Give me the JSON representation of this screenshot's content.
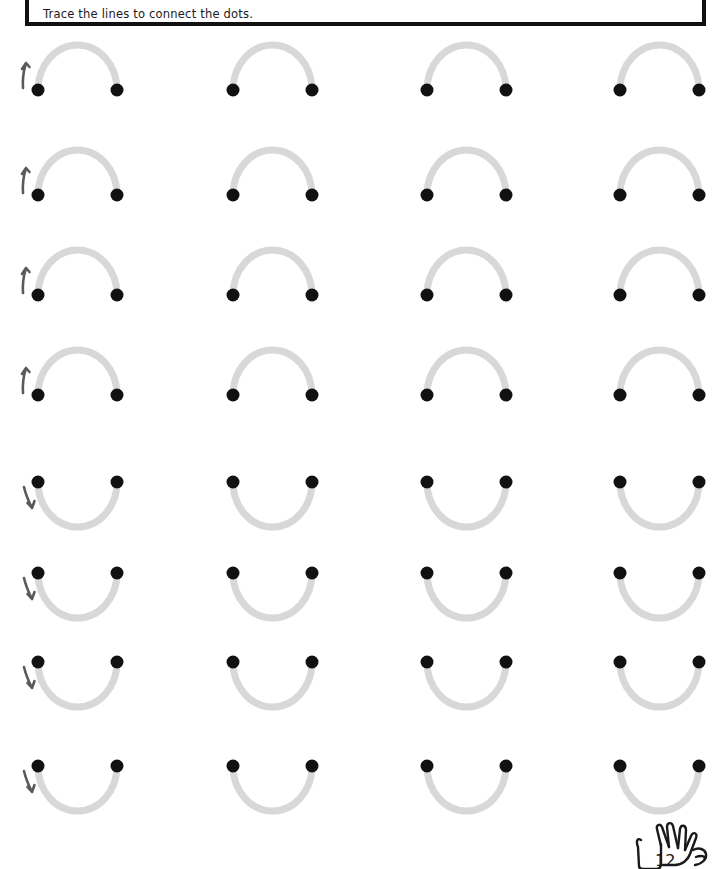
{
  "page": {
    "background_color": "#ffffff",
    "width": 723,
    "height": 869
  },
  "instruction": {
    "text": "Trace the lines to connect the dots.",
    "border_color": "#111111",
    "text_color": "#1a1a1a"
  },
  "colors": {
    "trace_line": "#d8d8d8",
    "dot": "#111111",
    "arrow": "#5a5a5a",
    "logo_outline": "#1a1a1a"
  },
  "grid": {
    "rows": 8,
    "columns": 4,
    "column_x": [
      38,
      233,
      427,
      620
    ],
    "row_y": [
      90,
      195,
      295,
      395,
      482,
      573,
      662,
      766
    ],
    "dot_span": 79,
    "dot_radius": 6.5,
    "arc_height": 45,
    "line_width": 7
  },
  "exercises": [
    {
      "row": 1,
      "shape": "arch-up",
      "items": [
        {
          "column": 1,
          "arrow": "up",
          "arrow_label": "start-arrow-up"
        },
        {
          "column": 2,
          "arrow": "none"
        },
        {
          "column": 3,
          "arrow": "none"
        },
        {
          "column": 4,
          "arrow": "none"
        }
      ]
    },
    {
      "row": 2,
      "shape": "arch-up",
      "items": [
        {
          "column": 1,
          "arrow": "up",
          "arrow_label": "start-arrow-up"
        },
        {
          "column": 2,
          "arrow": "none"
        },
        {
          "column": 3,
          "arrow": "none"
        },
        {
          "column": 4,
          "arrow": "none"
        }
      ]
    },
    {
      "row": 3,
      "shape": "arch-up",
      "items": [
        {
          "column": 1,
          "arrow": "up",
          "arrow_label": "start-arrow-up"
        },
        {
          "column": 2,
          "arrow": "none"
        },
        {
          "column": 3,
          "arrow": "none"
        },
        {
          "column": 4,
          "arrow": "none"
        }
      ]
    },
    {
      "row": 4,
      "shape": "arch-up",
      "items": [
        {
          "column": 1,
          "arrow": "up",
          "arrow_label": "start-arrow-up"
        },
        {
          "column": 2,
          "arrow": "none"
        },
        {
          "column": 3,
          "arrow": "none"
        },
        {
          "column": 4,
          "arrow": "none"
        }
      ]
    },
    {
      "row": 5,
      "shape": "arch-down",
      "items": [
        {
          "column": 1,
          "arrow": "down",
          "arrow_label": "start-arrow-down"
        },
        {
          "column": 2,
          "arrow": "none"
        },
        {
          "column": 3,
          "arrow": "none"
        },
        {
          "column": 4,
          "arrow": "none"
        }
      ]
    },
    {
      "row": 6,
      "shape": "arch-down",
      "items": [
        {
          "column": 1,
          "arrow": "down",
          "arrow_label": "start-arrow-down"
        },
        {
          "column": 2,
          "arrow": "none"
        },
        {
          "column": 3,
          "arrow": "none"
        },
        {
          "column": 4,
          "arrow": "none"
        }
      ]
    },
    {
      "row": 7,
      "shape": "arch-down",
      "items": [
        {
          "column": 1,
          "arrow": "down",
          "arrow_label": "start-arrow-down"
        },
        {
          "column": 2,
          "arrow": "none"
        },
        {
          "column": 3,
          "arrow": "none"
        },
        {
          "column": 4,
          "arrow": "none"
        }
      ]
    },
    {
      "row": 8,
      "shape": "arch-down",
      "items": [
        {
          "column": 1,
          "arrow": "down",
          "arrow_label": "start-arrow-down"
        },
        {
          "column": 2,
          "arrow": "none"
        },
        {
          "column": 3,
          "arrow": "none"
        },
        {
          "column": 4,
          "arrow": "none"
        }
      ]
    }
  ],
  "footer": {
    "logo_icon": "hand-icon",
    "logo_number": "12"
  }
}
